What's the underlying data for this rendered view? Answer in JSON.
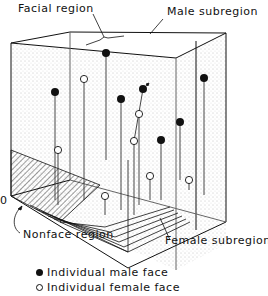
{
  "figure": {
    "type": "3D face-space diagram",
    "labels": {
      "facial_region": "Facial region",
      "male_subregion": "Male subregion",
      "female_subregion": "Female subregion",
      "nonface_region": "Nonface region",
      "origin": "0"
    },
    "legend": [
      {
        "marker": "filled-circle",
        "label": "Individual male face"
      },
      {
        "marker": "open-circle",
        "label": "Individual female face"
      }
    ],
    "points": {
      "male": [
        {
          "x": 106,
          "y": 53,
          "stem_to": 160
        },
        {
          "x": 55,
          "y": 92,
          "stem_to": 200
        },
        {
          "x": 121,
          "y": 99,
          "stem_to": 210
        },
        {
          "x": 143,
          "y": 89,
          "stem_to": 215
        },
        {
          "x": 204,
          "y": 78,
          "stem_to": 195
        },
        {
          "x": 180,
          "y": 122,
          "stem_to": 180
        },
        {
          "x": 161,
          "y": 140,
          "stem_to": 200
        }
      ],
      "female": [
        {
          "x": 84,
          "y": 79,
          "stem_to": 200
        },
        {
          "x": 139,
          "y": 114,
          "stem_to": 205
        },
        {
          "x": 134,
          "y": 141,
          "stem_to": 215
        },
        {
          "x": 58,
          "y": 150,
          "stem_to": 205
        },
        {
          "x": 150,
          "y": 176,
          "stem_to": 200
        },
        {
          "x": 189,
          "y": 180,
          "stem_to": 190
        },
        {
          "x": 105,
          "y": 196,
          "stem_to": 215
        }
      ]
    },
    "colors": {
      "ink": "#111111",
      "background": "#ffffff",
      "stipple": "#9a9a9a"
    }
  }
}
